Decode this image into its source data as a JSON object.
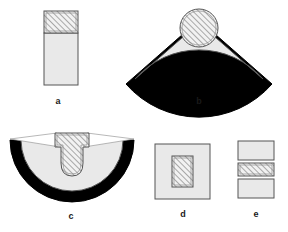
{
  "figure": {
    "title": "",
    "background_color": "#ffffff",
    "panels": [
      {
        "id": "a",
        "label": "a",
        "label_x": 58,
        "label_y": 104,
        "description": "rectangular block with hatched upper section over plain lower section",
        "parts": [
          {
            "name": "hatched-cap",
            "fill": "hatch",
            "shape": "rectangle"
          },
          {
            "name": "plain-body",
            "fill": "light-gray",
            "shape": "rectangle"
          }
        ]
      },
      {
        "id": "b",
        "label": "b",
        "label_x": 199,
        "label_y": 104,
        "description": "circular sector (fan) with black outer arc band and hatched circle at apex",
        "parts": [
          {
            "name": "hatched-circle",
            "fill": "hatch",
            "shape": "circle"
          },
          {
            "name": "sector-body",
            "fill": "light-gray",
            "shape": "sector"
          },
          {
            "name": "outer-band",
            "fill": "black",
            "shape": "arc-band"
          }
        ]
      },
      {
        "id": "c",
        "label": "c",
        "label_x": 71,
        "label_y": 219,
        "description": "semicircular disc with black outer rim and hatched central keel notch",
        "parts": [
          {
            "name": "outer-rim",
            "fill": "black",
            "shape": "half-annulus"
          },
          {
            "name": "inner-disc",
            "fill": "light-gray",
            "shape": "half-disc"
          },
          {
            "name": "hatched-keel",
            "fill": "hatch",
            "shape": "keel"
          }
        ]
      },
      {
        "id": "d",
        "label": "d",
        "label_x": 183,
        "label_y": 217,
        "description": "square plate with small hatched rectangle centered inside",
        "parts": [
          {
            "name": "outer-square",
            "fill": "light-gray",
            "shape": "rectangle"
          },
          {
            "name": "inner-hatched-rect",
            "fill": "hatch",
            "shape": "rectangle"
          }
        ]
      },
      {
        "id": "e",
        "label": "e",
        "label_x": 256,
        "label_y": 217,
        "description": "stack of three rectangles, hatched middle layer between two plain layers",
        "parts": [
          {
            "name": "top-block",
            "fill": "light-gray",
            "shape": "rectangle"
          },
          {
            "name": "middle-hatched-block",
            "fill": "hatch",
            "shape": "rectangle"
          },
          {
            "name": "bottom-block",
            "fill": "light-gray",
            "shape": "rectangle"
          }
        ]
      }
    ]
  },
  "colors": {
    "stroke": "#555555",
    "black_fill": "#000000",
    "light_gray_fill": "#e9e9e9",
    "hatch_line": "#6b6b6b",
    "hatch_bg": "#f2f2f2",
    "label_color": "#1a1a1a",
    "page_background": "#ffffff"
  }
}
